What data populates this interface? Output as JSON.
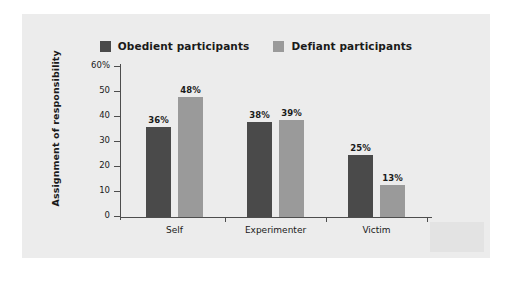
{
  "chart_data": {
    "type": "bar",
    "title": "",
    "xlabel": "",
    "ylabel": "Assignment of responsibility",
    "categories": [
      "Self",
      "Experimenter",
      "Victim"
    ],
    "series": [
      {
        "name": "Obedient participants",
        "color": "#4a4a4a",
        "values": [
          36,
          38,
          25
        ],
        "labels": [
          "36%",
          "38%",
          "25%"
        ]
      },
      {
        "name": "Defiant participants",
        "color": "#9a9a9a",
        "values": [
          48,
          39,
          13
        ],
        "labels": [
          "48%",
          "39%",
          "13%"
        ]
      }
    ],
    "ylim": [
      0,
      60
    ],
    "ytick_values": [
      0,
      10,
      20,
      30,
      40,
      50,
      60
    ],
    "ytick_labels": [
      "0",
      "10",
      "20",
      "30",
      "40",
      "50",
      "60%"
    ],
    "grid": false,
    "legend_position": "top-center"
  },
  "figure": {
    "background_color": "#ececec",
    "axis_color": "#4d4d4d"
  }
}
